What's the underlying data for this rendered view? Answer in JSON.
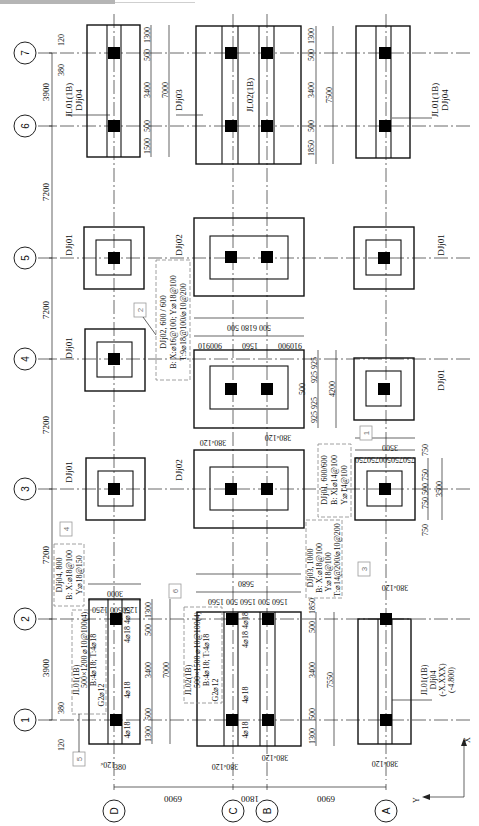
{
  "drawing": {
    "type": "foundation plan",
    "row_axes": [
      {
        "label": "7",
        "y": 53
      },
      {
        "label": "6",
        "y": 126
      },
      {
        "label": "5",
        "y": 258
      },
      {
        "label": "4",
        "y": 359
      },
      {
        "label": "3",
        "y": 489
      },
      {
        "label": "2",
        "y": 619
      },
      {
        "label": "1",
        "y": 720
      }
    ],
    "column_axes": [
      {
        "label": "D",
        "x": 114
      },
      {
        "label": "C",
        "x": 233
      },
      {
        "label": "B",
        "x": 267
      },
      {
        "label": "A",
        "x": 386
      }
    ],
    "row_spacings": [
      "3900",
      "7200",
      "7200",
      "7200",
      "7200",
      "3900"
    ],
    "column_spacings": [
      "6900",
      "1800",
      "6900"
    ],
    "footing_labels": {
      "d_top": [
        "JL01(1B)",
        "DJj04"
      ],
      "cb_top": "DJj03",
      "cb_mid_beam": "JL02(1B)",
      "a_top": [
        "JL01(1B)",
        "DJj04"
      ],
      "d_5": "DJj01",
      "cb_5": "DJj02",
      "a_5": "DJj01",
      "d_4": "DJj01",
      "a_4": "DJj01",
      "d_3": "DJj01",
      "cb_3": "DJj02",
      "a_bottom": [
        "JL01(1B)",
        "DJj04",
        "(-X.XXX)",
        "(-4.800)"
      ]
    },
    "dimensions": {
      "top_left_offsets": [
        "120",
        "380"
      ],
      "d_top_strip": [
        "1300",
        "500",
        "3400",
        "500",
        "1500"
      ],
      "d_top_total": "7000",
      "cb_top_strip": [
        "1300",
        "500",
        "3400",
        "500",
        "1850"
      ],
      "cb_top_total": "7500",
      "djj02_cross": [
        "900",
        "910",
        "1560",
        "910",
        "900"
      ],
      "djj02_cross_total": "500 6180 500",
      "djj02_along": [
        "925",
        "925",
        "500",
        "925",
        "925"
      ],
      "djj02_along_total": "4200",
      "djj01_cross": [
        "750",
        "750",
        "500",
        "750",
        "750"
      ],
      "djj01_cross_total": "3500",
      "djj01_along": [
        "750",
        "750",
        "500",
        "750",
        "750"
      ],
      "djj01_along_total": "3500",
      "cb_col_offsets_upper": [
        "380",
        "120",
        "120",
        "380"
      ],
      "cb_col_offsets_lower": [
        "380",
        "120",
        "120",
        "380"
      ],
      "a_col_offsets": [
        "380",
        "120"
      ],
      "d_col_offsets": [
        "120",
        "380"
      ],
      "djj04_cross": [
        "1250",
        "500",
        "1250"
      ],
      "djj04_cross_total": "3000",
      "djj03_cross": [
        "1560",
        "500",
        "1560",
        "500",
        "1560"
      ],
      "djj03_cross_total": "5680",
      "d_bot_strip": [
        "1300",
        "500",
        "3400",
        "500",
        "1300"
      ],
      "d_bot_total": "7000",
      "cb_bot_strip": [
        "1850",
        "500",
        "3400",
        "500",
        "1300"
      ],
      "cb_bot_total": "7550",
      "rebar_4_18": "4⌀18"
    },
    "callouts": [
      {
        "tag": "1",
        "lines": [
          "DJj01, 600/600",
          "B: X:⌀14@100",
          "Y:⌀14@100"
        ]
      },
      {
        "tag": "2",
        "lines": [
          "DJj02, 600 / 600",
          "B: X:⌀16@100; Y:⌀18@100",
          "T:9⌀18@100/⌀10@200"
        ]
      },
      {
        "tag": "3",
        "lines": [
          "DJj03, 1000",
          "B: X:⌀18@100",
          "Y:⌀18@100",
          "T:⌀14@200/⌀10@200"
        ]
      },
      {
        "tag": "4",
        "lines": [
          "DJj04, 800",
          "B: X:⌀18@100",
          "Y:⌀18@150"
        ]
      },
      {
        "tag": "5",
        "lines": [
          "JL01(1B)",
          "500×1200 ⌀10@100(4)",
          "B:4⌀18; T:4⌀18",
          "G2⌀12"
        ]
      },
      {
        "tag": "6",
        "lines": [
          "JL02(1B)",
          "500×1500 ⌀10@100(4)",
          "B:4⌀18; T:4⌀18",
          "G2⌀12"
        ]
      }
    ],
    "coordinate_axes": {
      "x": "X",
      "y": "Y"
    }
  }
}
